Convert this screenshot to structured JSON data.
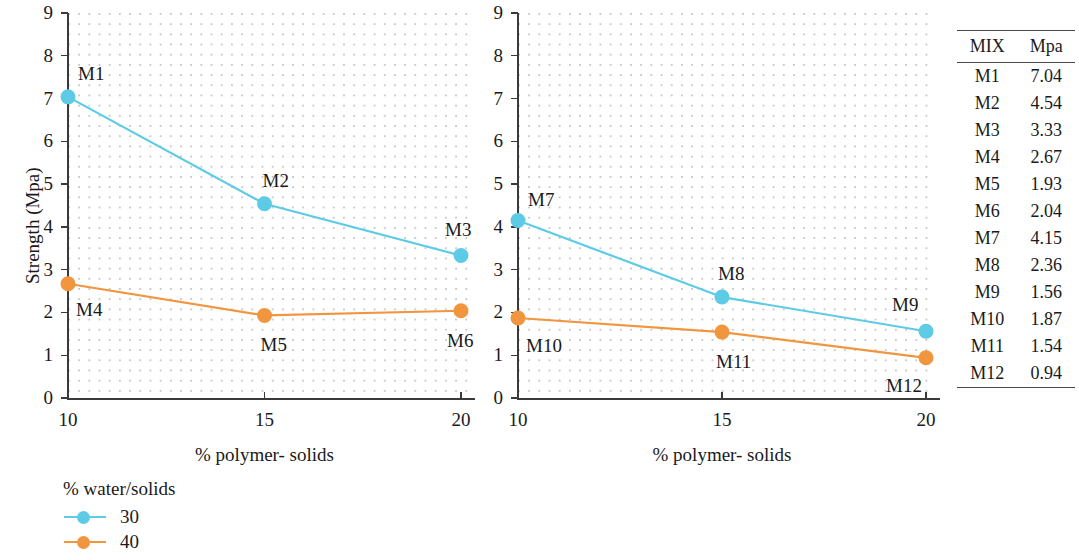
{
  "chart_data": [
    {
      "type": "line",
      "panel": "left",
      "title": "",
      "xlabel": "% polymer- solids",
      "ylabel": "Strength (Mpa)",
      "x": [
        10,
        15,
        20
      ],
      "xticks": [
        "10",
        "15",
        "20"
      ],
      "yticks": [
        "0",
        "1",
        "2",
        "3",
        "4",
        "5",
        "6",
        "7",
        "8",
        "9"
      ],
      "xlim": [
        10,
        20
      ],
      "ylim": [
        0,
        9
      ],
      "grid": "dotted",
      "series": [
        {
          "name": "30",
          "color": "#5ecbe6",
          "values": [
            7.04,
            4.54,
            3.33
          ],
          "point_labels": [
            "M1",
            "M2",
            "M3"
          ]
        },
        {
          "name": "40",
          "color": "#f2953f",
          "values": [
            2.67,
            1.93,
            2.04
          ],
          "point_labels": [
            "M4",
            "M5",
            "M6"
          ]
        }
      ]
    },
    {
      "type": "line",
      "panel": "right",
      "title": "",
      "xlabel": "% polymer- solids",
      "ylabel": "",
      "x": [
        10,
        15,
        20
      ],
      "xticks": [
        "10",
        "15",
        "20"
      ],
      "yticks": [
        "0",
        "1",
        "2",
        "3",
        "4",
        "5",
        "6",
        "7",
        "8",
        "9"
      ],
      "xlim": [
        10,
        20
      ],
      "ylim": [
        0,
        9
      ],
      "grid": "dotted",
      "series": [
        {
          "name": "30",
          "color": "#5ecbe6",
          "values": [
            4.15,
            2.36,
            1.56
          ],
          "point_labels": [
            "M7",
            "M8",
            "M9"
          ]
        },
        {
          "name": "40",
          "color": "#f2953f",
          "values": [
            1.87,
            1.54,
            0.94
          ],
          "point_labels": [
            "M10",
            "M11",
            "M12"
          ]
        }
      ]
    }
  ],
  "legend": {
    "title": "% water/solids",
    "position": "bottom-left",
    "items": [
      {
        "label": "30",
        "color": "#5ecbe6"
      },
      {
        "label": "40",
        "color": "#f2953f"
      }
    ]
  },
  "table": {
    "headers": [
      "MIX",
      "Mpa"
    ],
    "rows": [
      [
        "M1",
        "7.04"
      ],
      [
        "M2",
        "4.54"
      ],
      [
        "M3",
        "3.33"
      ],
      [
        "M4",
        "2.67"
      ],
      [
        "M5",
        "1.93"
      ],
      [
        "M6",
        "2.04"
      ],
      [
        "M7",
        "4.15"
      ],
      [
        "M8",
        "2.36"
      ],
      [
        "M9",
        "1.56"
      ],
      [
        "M10",
        "1.87"
      ],
      [
        "M11",
        "1.54"
      ],
      [
        "M12",
        "0.94"
      ]
    ]
  },
  "colors": {
    "series_30": "#5ecbe6",
    "series_40": "#f2953f",
    "axis": "#3a3a3a",
    "grid_dot": "#c9c9c9",
    "text": "#1a1a1a"
  }
}
